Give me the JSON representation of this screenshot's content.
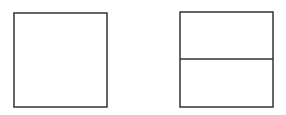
{
  "diagram": {
    "stroke_color": "#333333",
    "background": "#ffffff",
    "shapes": [
      {
        "name": "left-square",
        "x": 14,
        "y": 13,
        "width": 93,
        "height": 94
      },
      {
        "name": "right-rectangle",
        "x": 180,
        "y": 12,
        "width": 93,
        "height": 95,
        "divider_y": 59
      }
    ]
  }
}
